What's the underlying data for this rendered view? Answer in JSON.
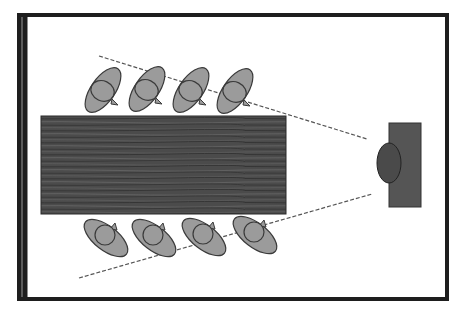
{
  "diagram": {
    "title": "",
    "colors": {
      "background": "#ffffff",
      "frame": "#1e1e1e",
      "frame_inner_line": "#9a9a9a",
      "table": "#4b4b4b",
      "table_grain_light": "#6a6a6a",
      "table_grain_dark": "#333333",
      "person_fill": "#9b9b9b",
      "person_stroke": "#3a3a3a",
      "screen": "#555555",
      "presenter_head": "#4a4a4a",
      "sightline": "#555555"
    },
    "frame": {
      "x": 19,
      "y": 15,
      "width": 428,
      "height": 284
    },
    "table": {
      "x": 41,
      "y": 116,
      "width": 245,
      "height": 98
    },
    "screen": {
      "x": 389,
      "y": 123,
      "width": 32,
      "height": 84
    },
    "presenter_head": {
      "cx": 389,
      "cy": 163,
      "rx": 12,
      "ry": 20
    },
    "sightlines": [
      {
        "x1": 99,
        "y1": 56,
        "x2": 367,
        "y2": 139
      },
      {
        "x1": 79,
        "y1": 278,
        "x2": 372,
        "y2": 194
      }
    ],
    "top_row": [
      {
        "cx": 103,
        "cy": 90
      },
      {
        "cx": 147,
        "cy": 89
      },
      {
        "cx": 191,
        "cy": 90
      },
      {
        "cx": 235,
        "cy": 91
      }
    ],
    "bottom_row": [
      {
        "cx": 106,
        "cy": 238
      },
      {
        "cx": 154,
        "cy": 238
      },
      {
        "cx": 204,
        "cy": 237
      },
      {
        "cx": 255,
        "cy": 235
      }
    ]
  }
}
